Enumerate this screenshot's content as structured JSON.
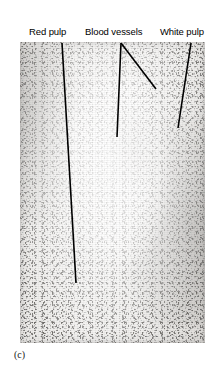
{
  "figure": {
    "panel_caption": "(c)"
  },
  "labels": [
    {
      "id": "red-pulp",
      "text": "Red pulp"
    },
    {
      "id": "blood-vessels",
      "text": "Blood vessels"
    },
    {
      "id": "white-pulp",
      "text": "White pulp"
    }
  ],
  "micrograph": {
    "regions": [
      {
        "name": "red-pulp-region",
        "description": "dense stippled tissue at left and right margins"
      },
      {
        "name": "white-pulp-region",
        "description": "pale lightly stippled nodule in the centre"
      },
      {
        "name": "blood-vessels-region",
        "description": "vessels within the central white pulp"
      }
    ]
  },
  "leader_lines": [
    {
      "id": "leader-red-pulp",
      "x1": 62,
      "y1": 43,
      "x2": 76,
      "y2": 283
    },
    {
      "id": "leader-blood-vessel-1",
      "x1": 121,
      "y1": 43,
      "x2": 117,
      "y2": 137
    },
    {
      "id": "leader-blood-vessel-2",
      "x1": 121,
      "y1": 43,
      "x2": 156,
      "y2": 89
    },
    {
      "id": "leader-white-pulp",
      "x1": 191,
      "y1": 43,
      "x2": 178,
      "y2": 128
    }
  ],
  "colors": {
    "page_background": "#ffffff",
    "leader_line": "#000000",
    "label_text": "#000000",
    "caption_text": "#1a1a1a",
    "plate_tone": "#f1f0ee"
  }
}
